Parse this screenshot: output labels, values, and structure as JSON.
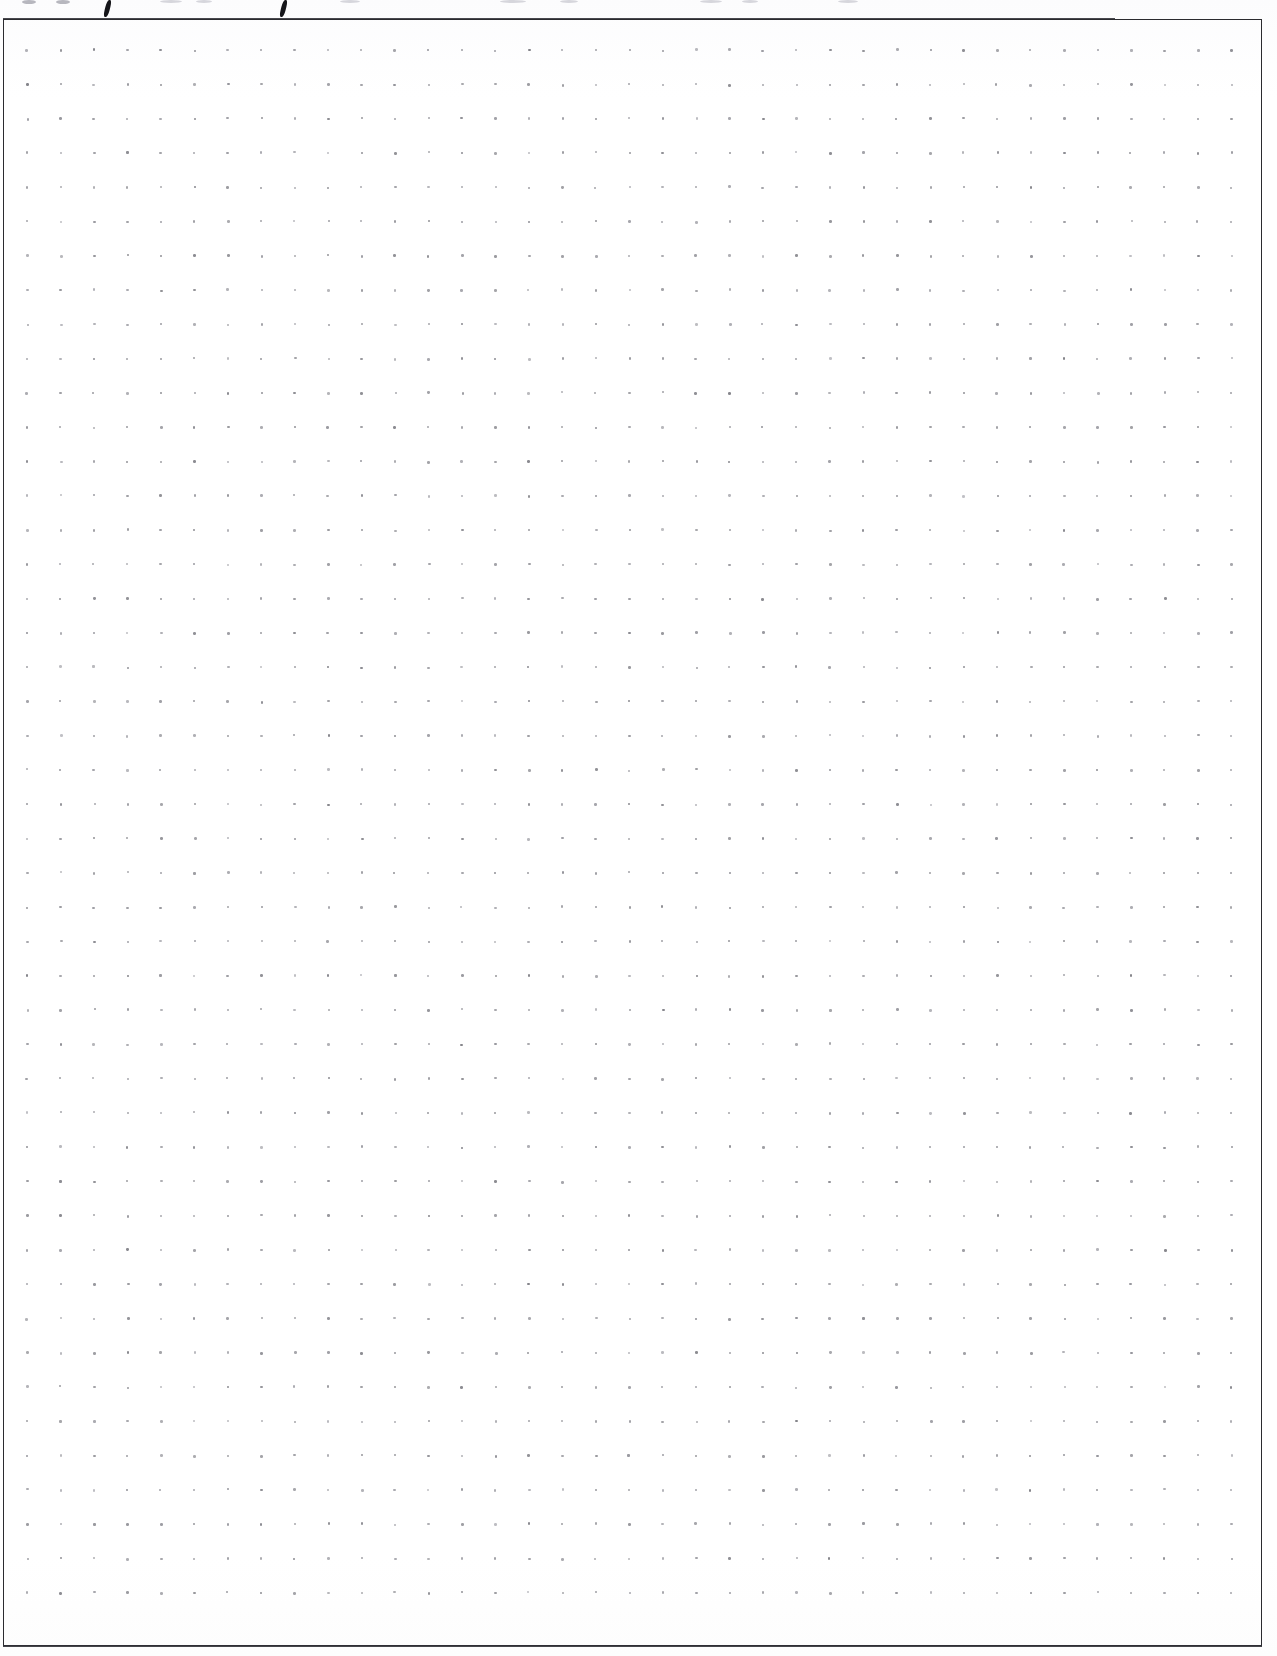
{
  "page": {
    "kind": "scanned-dot-grid-notebook-page",
    "width": 1277,
    "height": 1656,
    "background_color": "#ffffff",
    "content_text": "",
    "is_blank": true
  },
  "border": {
    "name": "page-border-rectangle",
    "left": 3,
    "top": 19,
    "right": 1262,
    "bottom": 1646,
    "stroke_color": "#2b2b2f",
    "stroke_width": 1.4
  },
  "dot_grid": {
    "name": "dot-grid",
    "origin_x": 26,
    "origin_y": 49,
    "spacing_x": 33.45,
    "spacing_y": 34.28,
    "columns": 37,
    "rows": 46,
    "dot_diameter": 2.4,
    "dot_color": "#8d8d94"
  },
  "handwriting_remnants": {
    "name": "cut-off-handwriting-above-border",
    "description": "Bottom edges of handwritten characters cropped by the top of the scan",
    "strokes": [
      {
        "x": 105,
        "y": 0,
        "w": 5,
        "h": 17,
        "skew": -14,
        "tone": "dark"
      },
      {
        "x": 281,
        "y": 0,
        "w": 5,
        "h": 17,
        "skew": -14,
        "tone": "dark"
      },
      {
        "x": 22,
        "y": 0,
        "w": 14,
        "h": 4,
        "skew": 0,
        "tone": "faint"
      },
      {
        "x": 56,
        "y": 0,
        "w": 14,
        "h": 4,
        "skew": 0,
        "tone": "faint"
      },
      {
        "x": 160,
        "y": 0,
        "w": 22,
        "h": 3,
        "skew": 0,
        "tone": "veryfaint"
      },
      {
        "x": 196,
        "y": 0,
        "w": 16,
        "h": 3,
        "skew": 0,
        "tone": "veryfaint"
      },
      {
        "x": 340,
        "y": 0,
        "w": 20,
        "h": 3,
        "skew": 0,
        "tone": "veryfaint"
      },
      {
        "x": 500,
        "y": 0,
        "w": 26,
        "h": 3,
        "skew": 0,
        "tone": "veryfaint"
      },
      {
        "x": 560,
        "y": 0,
        "w": 18,
        "h": 3,
        "skew": 0,
        "tone": "veryfaint"
      },
      {
        "x": 700,
        "y": 0,
        "w": 22,
        "h": 3,
        "skew": 0,
        "tone": "veryfaint"
      },
      {
        "x": 742,
        "y": 0,
        "w": 16,
        "h": 3,
        "skew": 0,
        "tone": "veryfaint"
      },
      {
        "x": 838,
        "y": 0,
        "w": 20,
        "h": 3,
        "skew": 0,
        "tone": "veryfaint"
      }
    ]
  }
}
